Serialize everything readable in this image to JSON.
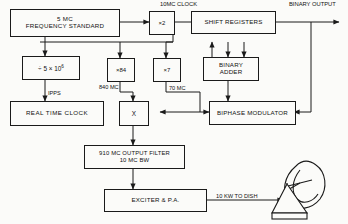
{
  "diagram": {
    "blocks": {
      "freq_standard": {
        "line1": "5 MC",
        "line2": "FREQUENCY STANDARD"
      },
      "divider": {
        "prefix": "÷ 5 × 10",
        "exponent": "6"
      },
      "real_time_clock": {
        "line1": "REAL TIME CLOCK"
      },
      "mult_x2": {
        "line1": "×2"
      },
      "mult_x84": {
        "line1": "×84"
      },
      "mult_x7": {
        "line1": "×7"
      },
      "mixer": {
        "line1": "X"
      },
      "shift_registers": {
        "line1": "SHIFT  REGISTERS"
      },
      "binary_adder": {
        "line1": "BINARY",
        "line2": "ADDER"
      },
      "biphase_modulator": {
        "line1": "BIPHASE  MODULATOR"
      },
      "output_filter": {
        "line1": "910 MC  OUTPUT  FILTER",
        "line2": "10 MC BW"
      },
      "exciter": {
        "line1": "EXCITER  & P.A."
      }
    },
    "labels": {
      "clock": {
        "line1": "10MC",
        "line2": "CLOCK"
      },
      "binary_output": {
        "line1": "BINARY",
        "line2": "OUTPUT"
      },
      "ipps": "IPPS",
      "mc_840": "840 MC",
      "mc_70": "70 MC",
      "kw_to_dish": "10 KW TO DISH"
    },
    "icons": {
      "dish": "parabolic-dish-antenna"
    },
    "colors": {
      "stroke": "#1a1a1a",
      "background": "#fbfbf9",
      "text": "#111111"
    }
  }
}
